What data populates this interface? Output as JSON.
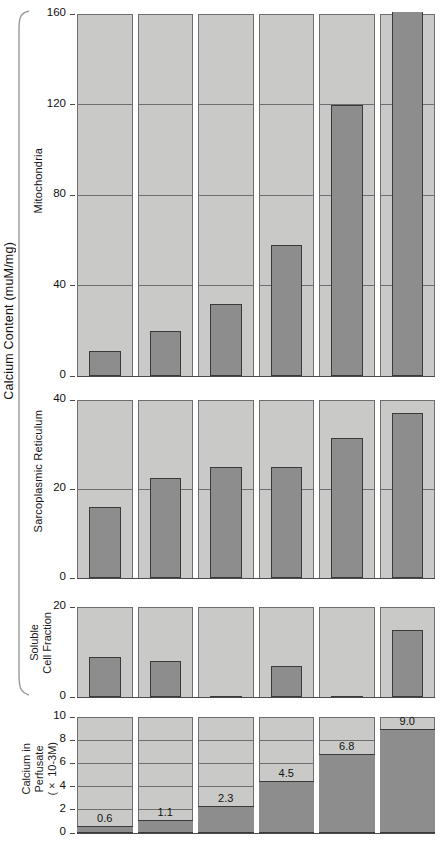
{
  "figure": {
    "main_axis_label": "Calcium Content (muM/mg)",
    "bottom_axis_label_line1": "Calcium in",
    "bottom_axis_label_line2": "Perfusate",
    "bottom_axis_label_line3": "(× 10-3M)",
    "soluble_label_line1": "Soluble",
    "soluble_label_line2": "Cell Fraction",
    "mitochondria_label": "Mitochondria",
    "sarcoplasmic_label": "Sarcoplasmic Reticulum",
    "colors": {
      "bar_fill": "#8d8d8d",
      "bar_stroke": "#3a3a3a",
      "panel_background": "#c9c9c7",
      "gridline": "#6e6e6e",
      "page_background": "#ffffff"
    }
  },
  "chart_data": [
    {
      "type": "bar",
      "title": "Mitochondria",
      "ylabel": "Calcium Content (muM/mg)",
      "xlabel": "",
      "categories": [
        "0.6",
        "1.1",
        "2.3",
        "4.5",
        "6.8",
        "9.0"
      ],
      "values": [
        11,
        20,
        32,
        58,
        120,
        168
      ],
      "ylim": [
        0,
        160
      ],
      "yticks": [
        0,
        40,
        80,
        120,
        160
      ],
      "ytick_labels": [
        "0",
        "40",
        "80",
        "120",
        "160"
      ],
      "grid": true,
      "legend": "none",
      "notes": "last bar exceeds axis maximum and is clipped at 160"
    },
    {
      "type": "bar",
      "title": "Sarcoplasmic Reticulum",
      "ylabel": "Calcium Content (muM/mg)",
      "xlabel": "",
      "categories": [
        "0.6",
        "1.1",
        "2.3",
        "4.5",
        "6.8",
        "9.0"
      ],
      "values": [
        16,
        22.5,
        25,
        25,
        31.5,
        37
      ],
      "ylim": [
        0,
        40
      ],
      "yticks": [
        0,
        20,
        40
      ],
      "ytick_labels": [
        "0",
        "20",
        "40"
      ],
      "grid": true,
      "legend": "none"
    },
    {
      "type": "bar",
      "title": "Soluble Cell Fraction",
      "ylabel": "Calcium Content (muM/mg)",
      "xlabel": "",
      "categories": [
        "0.6",
        "1.1",
        "2.3",
        "4.5",
        "6.8",
        "9.0"
      ],
      "values": [
        9,
        8,
        0.3,
        7,
        0.3,
        15
      ],
      "ylim": [
        0,
        20
      ],
      "yticks": [
        0,
        20
      ],
      "ytick_labels": [
        "0",
        "20"
      ],
      "grid": true,
      "legend": "none"
    },
    {
      "type": "bar",
      "title": "Calcium in Perfusate (× 10-3M)",
      "ylabel": "Calcium in Perfusate (× 10-3M)",
      "xlabel": "",
      "categories": [
        "1",
        "2",
        "3",
        "4",
        "5",
        "6"
      ],
      "values": [
        0.6,
        1.1,
        2.3,
        4.5,
        6.8,
        9.0
      ],
      "data_labels": [
        "0.6",
        "1.1",
        "2.3",
        "4.5",
        "6.8",
        "9.0"
      ],
      "ylim": [
        0,
        10
      ],
      "yticks": [
        0,
        2,
        4,
        6,
        8,
        10
      ],
      "ytick_labels": [
        "0",
        "2",
        "4",
        "6",
        "8",
        "10"
      ],
      "grid": true,
      "legend": "none"
    }
  ],
  "ticks": {
    "mito": [
      "160",
      "120",
      "80",
      "40",
      "0"
    ],
    "sr": [
      "40",
      "20",
      "0"
    ],
    "soluble": [
      "20",
      "0"
    ],
    "perfusate": [
      "10",
      "8",
      "6",
      "4",
      "2",
      "0"
    ]
  },
  "value_labels": [
    "0.6",
    "1.1",
    "2.3",
    "4.5",
    "6.8",
    "9.0"
  ]
}
